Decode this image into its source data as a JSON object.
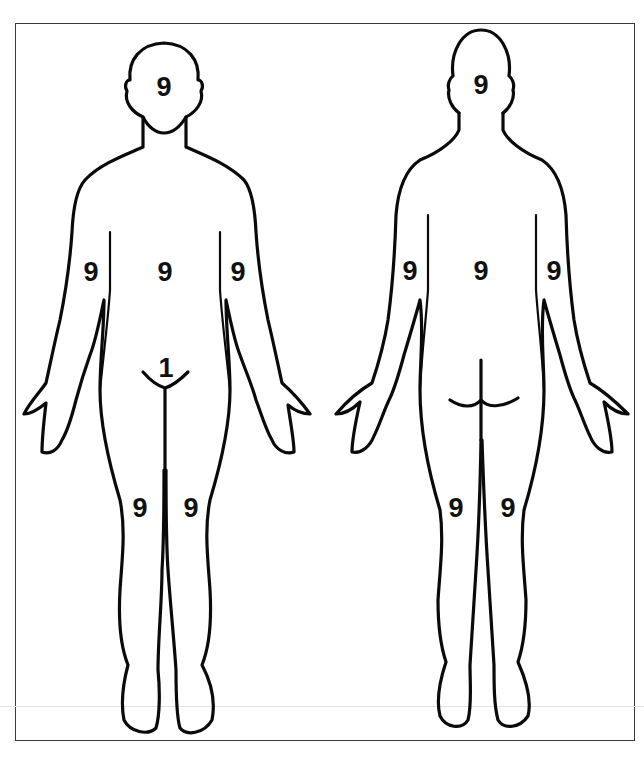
{
  "diagram": {
    "title": "",
    "views": [
      {
        "id": "front",
        "name": "Anterior view",
        "regions": [
          {
            "name": "head",
            "value": "9",
            "x": 164,
            "y": 87
          },
          {
            "name": "torso",
            "value": "9",
            "x": 165,
            "y": 272
          },
          {
            "name": "right-arm",
            "value": "9",
            "x": 91,
            "y": 272
          },
          {
            "name": "left-arm",
            "value": "9",
            "x": 238,
            "y": 272
          },
          {
            "name": "genitals",
            "value": "1",
            "x": 166,
            "y": 368
          },
          {
            "name": "right-leg",
            "value": "9",
            "x": 140,
            "y": 508
          },
          {
            "name": "left-leg",
            "value": "9",
            "x": 191,
            "y": 508
          }
        ]
      },
      {
        "id": "back",
        "name": "Posterior view",
        "regions": [
          {
            "name": "head",
            "value": "9",
            "x": 481,
            "y": 85
          },
          {
            "name": "torso",
            "value": "9",
            "x": 481,
            "y": 271
          },
          {
            "name": "right-arm",
            "value": "9",
            "x": 410,
            "y": 271
          },
          {
            "name": "left-arm",
            "value": "9",
            "x": 554,
            "y": 271
          },
          {
            "name": "right-leg",
            "value": "9",
            "x": 456,
            "y": 508
          },
          {
            "name": "left-leg",
            "value": "9",
            "x": 508,
            "y": 508
          }
        ]
      }
    ],
    "colors": {
      "outline": "#0a0a0a",
      "frame": "#3a3a3a",
      "background": "#ffffff"
    }
  }
}
